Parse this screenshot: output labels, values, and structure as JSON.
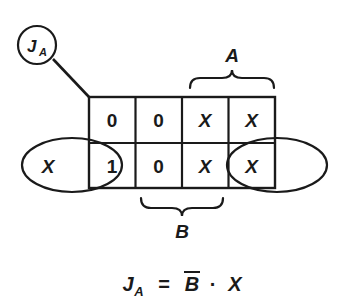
{
  "figure": {
    "ink_color": "#1a1a1a",
    "background_color": "#ffffff"
  },
  "node": {
    "label_main": "J",
    "label_sub": "A",
    "icon": "circle-node"
  },
  "kmap": {
    "rows": 2,
    "cols": 4,
    "cells": [
      [
        "0",
        "0",
        "X",
        "X"
      ],
      [
        "1",
        "0",
        "X",
        "X"
      ]
    ],
    "wrap_left_marker": "X"
  },
  "braces": [
    {
      "name": "A",
      "label": "A",
      "position": "top",
      "spans_columns": [
        3,
        4
      ]
    },
    {
      "name": "B",
      "label": "B",
      "position": "bottom",
      "spans_columns": [
        2,
        3
      ]
    }
  ],
  "groupings": [
    {
      "name": "left-wrap-group",
      "shape": "ellipse",
      "covers": "bottom-left cell and wrap-around"
    },
    {
      "name": "right-wrap-group",
      "shape": "ellipse",
      "covers": "bottom-right cell and wrap-around"
    }
  ],
  "equation": {
    "lhs_main": "J",
    "lhs_sub": "A",
    "equals": "=",
    "term_1": "B",
    "term_1_complemented": true,
    "operator": "·",
    "term_2": "X",
    "plain_text": "JA = B̄ · X"
  }
}
